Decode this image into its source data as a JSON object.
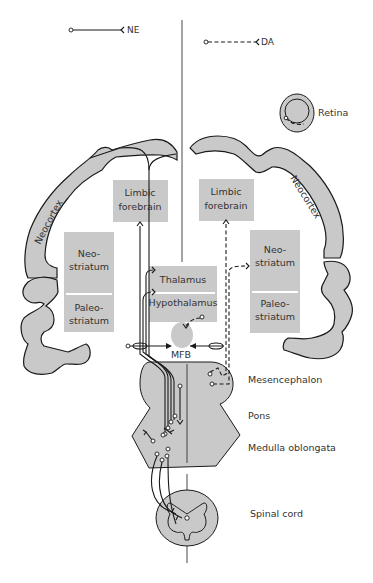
{
  "legend": {
    "ne": {
      "label": "NE",
      "style": "solid"
    },
    "da": {
      "label": "DA",
      "style": "dashed"
    }
  },
  "regions": {
    "retina": "Retina",
    "neocortex_left": "Neocortex",
    "neocortex_right": "Neocortex",
    "limbic_left": [
      "Limbic",
      "forebrain"
    ],
    "limbic_right": [
      "Limbic",
      "forebrain"
    ],
    "neostriatum_left": [
      "Neo-",
      "striatum"
    ],
    "paleostriatum_left": [
      "Paleo-",
      "striatum"
    ],
    "neostriatum_right": [
      "Neo-",
      "striatum"
    ],
    "paleostriatum_right": [
      "Paleo-",
      "striatum"
    ],
    "thalamus": "Thalamus",
    "hypothalamus": "Hypothalamus",
    "mfb": "MFB"
  },
  "side_labels": {
    "mesencephalon": "Mesencephalon",
    "pons": "Pons",
    "medulla": "Medulla oblongata",
    "spinal_cord": "Spinal cord"
  },
  "colors": {
    "region_fill": "#c9c9c9",
    "line": "#1a1a1a",
    "background": "#ffffff"
  }
}
